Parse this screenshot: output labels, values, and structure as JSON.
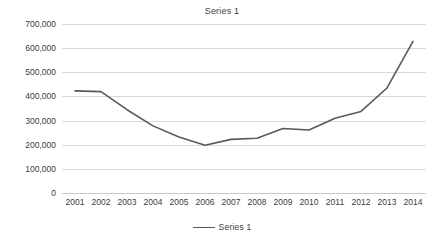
{
  "chart_data": {
    "type": "line",
    "title": "Series 1",
    "xlabel": "",
    "ylabel": "",
    "categories": [
      "2001",
      "2002",
      "2003",
      "2004",
      "2005",
      "2006",
      "2007",
      "2008",
      "2009",
      "2010",
      "2011",
      "2012",
      "2013",
      "2014"
    ],
    "series": [
      {
        "name": "Series 1",
        "values": [
          423000,
          420000,
          345000,
          278000,
          232000,
          198000,
          222000,
          227000,
          267000,
          261000,
          310000,
          338000,
          435000,
          628000
        ],
        "color": "#595959"
      }
    ],
    "ylim": [
      0,
      700000
    ],
    "y_ticks": [
      0,
      100000,
      200000,
      300000,
      400000,
      500000,
      600000,
      700000
    ],
    "y_tick_labels": [
      "0",
      "100,000",
      "200,000",
      "300,000",
      "400,000",
      "500,000",
      "600,000",
      "700,000"
    ],
    "x_tick_labels": [
      "2001",
      "2002",
      "2003",
      "2004",
      "2005",
      "2006",
      "2007",
      "2008",
      "2009",
      "2010",
      "2011",
      "2012",
      "2013",
      "2014"
    ],
    "grid": true,
    "legend": [
      "Series 1"
    ],
    "legend_position": "bottom"
  },
  "legend": {
    "entry_label": "Series 1"
  },
  "colors": {
    "line": "#595959",
    "grid": "#d9d9d9",
    "text": "#3c3c3c",
    "background": "#ffffff"
  }
}
